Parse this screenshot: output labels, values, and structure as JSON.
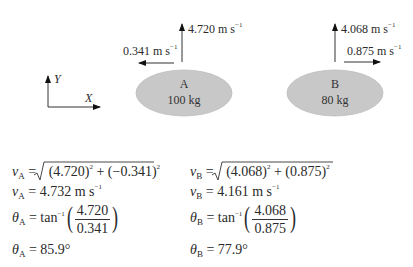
{
  "axes": {
    "x_label": "X",
    "y_label": "Y"
  },
  "body_a": {
    "name": "A",
    "mass": "100 kg",
    "v_up_label": "4.720 m s",
    "v_left_label": "0.341 m s",
    "unit_exp": "−1"
  },
  "body_b": {
    "name": "B",
    "mass": "80 kg",
    "v_up_label": "4.068 m s",
    "v_right_label": "0.875 m s",
    "unit_exp": "−1"
  },
  "colors": {
    "ellipse_fill": "#c8c8c8",
    "ellipse_stroke": "#bdbdbd",
    "arrow": "#111111"
  },
  "equations_a": {
    "v_sym": "v",
    "sub": "A",
    "line1_rhs_1": "(4.720)",
    "line1_rhs_2": " + (−0.341)",
    "sq": "2",
    "line2_rhs": "4.732 m s",
    "line2_exp": "−1",
    "theta_sym": "θ",
    "tan_label": "tan",
    "tan_exp": "−1",
    "frac_num": "4.720",
    "frac_den": "0.341",
    "angle": "85.9°"
  },
  "equations_b": {
    "v_sym": "v",
    "sub": "B",
    "line1_rhs_1": "(4.068)",
    "line1_rhs_2": " + (0.875)",
    "sq": "2",
    "line2_rhs": "4.161 m s",
    "line2_exp": "−1",
    "theta_sym": "θ",
    "tan_label": "tan",
    "tan_exp": "−1",
    "frac_num": "4.068",
    "frac_den": "0.875",
    "angle": "77.9°"
  },
  "symbols": {
    "equals": "="
  }
}
